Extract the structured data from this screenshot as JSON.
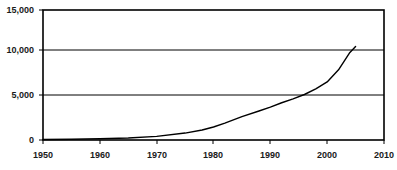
{
  "chart_data": {
    "type": "line",
    "title": "",
    "subtitle": "",
    "xlabel": "",
    "ylabel": "",
    "xlim": [
      1950,
      2010
    ],
    "ylim": [
      0,
      15000
    ],
    "grid": true,
    "legend": null,
    "x_ticks": [
      1950,
      1960,
      1970,
      1980,
      1990,
      2000,
      2010
    ],
    "x_tick_labels": [
      "1950",
      "1960",
      "1970",
      "1980",
      "1990",
      "2000",
      "2010"
    ],
    "y_ticks": [
      0,
      5000,
      10000,
      15000
    ],
    "y_tick_labels": [
      "0",
      "5,000",
      "10,000",
      "15,000"
    ],
    "gridlines_y": [
      5000,
      10000
    ],
    "line_color": "#000000",
    "frame_color": "#000000",
    "background": "#ffffff",
    "series": [
      {
        "name": "",
        "x": [
          1950,
          1955,
          1960,
          1965,
          1970,
          1975,
          1978,
          1980,
          1982,
          1985,
          1988,
          1990,
          1992,
          1994,
          1996,
          1998,
          2000,
          2002,
          2003,
          2004,
          2005
        ],
        "values": [
          60,
          90,
          140,
          230,
          420,
          800,
          1150,
          1500,
          1950,
          2700,
          3350,
          3800,
          4300,
          4750,
          5250,
          5900,
          6700,
          8100,
          9100,
          10100,
          10800
        ]
      }
    ]
  },
  "axes": {
    "plot_left_px": 43,
    "plot_right_px": 384,
    "plot_top_px": 10,
    "plot_bottom_px": 140
  }
}
